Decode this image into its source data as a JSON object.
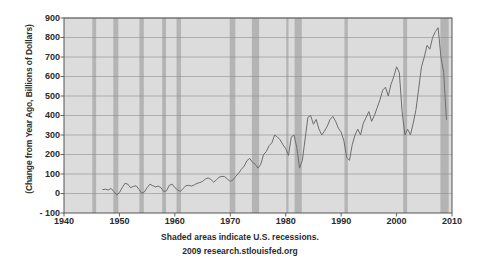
{
  "chart_data": {
    "type": "line",
    "title": "",
    "subtitle": "",
    "xlabel": "",
    "ylabel": "(Change from Year Ago, Billions of Dollars)",
    "xlim": [
      1940,
      2010
    ],
    "ylim": [
      -100,
      900
    ],
    "xticks": [
      1940,
      1950,
      1960,
      1970,
      1980,
      1990,
      2000,
      2010
    ],
    "yticks": [
      -100,
      0,
      100,
      200,
      300,
      400,
      500,
      600,
      700,
      800,
      900
    ],
    "grid": "horizontal",
    "legend": "none",
    "line_color": "#6e6e6e",
    "plot_bg_color": "#dcdcdc",
    "recession_band_color": "#b4b4b4",
    "axis_color": "#555555",
    "text_color": "#2b2b2b",
    "page_bg_color": "#ffffff",
    "caption_line1": "Shaded areas indicate U.S. recessions.",
    "caption_line2": "2009 research.stlouisfed.org",
    "recessions": [
      {
        "start": 1945.1,
        "end": 1945.8
      },
      {
        "start": 1948.9,
        "end": 1949.8
      },
      {
        "start": 1953.6,
        "end": 1954.4
      },
      {
        "start": 1957.7,
        "end": 1958.4
      },
      {
        "start": 1960.3,
        "end": 1961.1
      },
      {
        "start": 1969.9,
        "end": 1970.9
      },
      {
        "start": 1973.9,
        "end": 1975.2
      },
      {
        "start": 1980.1,
        "end": 1980.5
      },
      {
        "start": 1981.6,
        "end": 1982.9
      },
      {
        "start": 1990.6,
        "end": 1991.2
      },
      {
        "start": 2001.2,
        "end": 2001.9
      },
      {
        "start": 2007.9,
        "end": 2009.4
      }
    ],
    "x": [
      1947.0,
      1947.5,
      1948.0,
      1948.5,
      1949.0,
      1949.5,
      1950.0,
      1950.5,
      1951.0,
      1951.5,
      1952.0,
      1952.5,
      1953.0,
      1953.5,
      1954.0,
      1954.5,
      1955.0,
      1955.5,
      1956.0,
      1956.5,
      1957.0,
      1957.5,
      1958.0,
      1958.5,
      1959.0,
      1959.5,
      1960.0,
      1960.5,
      1961.0,
      1961.5,
      1962.0,
      1962.5,
      1963.0,
      1963.5,
      1964.0,
      1964.5,
      1965.0,
      1965.5,
      1966.0,
      1966.5,
      1967.0,
      1967.5,
      1968.0,
      1968.5,
      1969.0,
      1969.5,
      1970.0,
      1970.5,
      1971.0,
      1971.5,
      1972.0,
      1972.5,
      1973.0,
      1973.5,
      1974.0,
      1974.5,
      1975.0,
      1975.5,
      1976.0,
      1976.5,
      1977.0,
      1977.5,
      1978.0,
      1978.5,
      1979.0,
      1979.5,
      1980.0,
      1980.5,
      1981.0,
      1981.5,
      1982.0,
      1982.5,
      1983.0,
      1983.5,
      1984.0,
      1984.5,
      1985.0,
      1985.5,
      1986.0,
      1986.5,
      1987.0,
      1987.5,
      1988.0,
      1988.5,
      1989.0,
      1989.5,
      1990.0,
      1990.5,
      1991.0,
      1991.5,
      1992.0,
      1992.5,
      1993.0,
      1993.5,
      1994.0,
      1994.5,
      1995.0,
      1995.5,
      1996.0,
      1996.5,
      1997.0,
      1997.5,
      1998.0,
      1998.5,
      1999.0,
      1999.5,
      2000.0,
      2000.5,
      2001.0,
      2001.5,
      2002.0,
      2002.5,
      2003.0,
      2003.5,
      2004.0,
      2004.5,
      2005.0,
      2005.5,
      2006.0,
      2006.5,
      2007.0,
      2007.5,
      2008.0,
      2008.5,
      2009.0
    ],
    "values": [
      20,
      22,
      18,
      26,
      10,
      -8,
      5,
      30,
      52,
      48,
      30,
      36,
      40,
      22,
      2,
      8,
      30,
      48,
      40,
      34,
      38,
      30,
      10,
      14,
      42,
      48,
      30,
      18,
      10,
      26,
      40,
      42,
      38,
      44,
      52,
      56,
      62,
      74,
      80,
      72,
      58,
      70,
      84,
      88,
      86,
      74,
      62,
      70,
      88,
      104,
      124,
      140,
      168,
      180,
      160,
      150,
      130,
      150,
      200,
      215,
      245,
      260,
      300,
      290,
      275,
      250,
      230,
      195,
      290,
      300,
      235,
      130,
      170,
      280,
      390,
      400,
      355,
      380,
      330,
      300,
      320,
      345,
      380,
      395,
      370,
      335,
      315,
      270,
      185,
      170,
      250,
      300,
      330,
      300,
      360,
      390,
      420,
      370,
      400,
      440,
      480,
      530,
      545,
      500,
      560,
      600,
      650,
      620,
      420,
      300,
      330,
      300,
      360,
      430,
      540,
      650,
      700,
      760,
      740,
      800,
      830,
      850,
      700,
      620,
      380
    ]
  }
}
